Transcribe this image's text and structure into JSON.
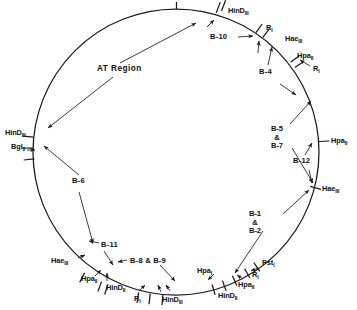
{
  "diagram": {
    "type": "circular-restriction-map",
    "title_region": "AT Region",
    "circle": {
      "cx": 176,
      "cy": 152,
      "r": 143
    },
    "enzyme_sites": [
      {
        "id": "hind3-top",
        "label": "HinD",
        "sub": "III",
        "x": 228,
        "y": 11,
        "align": "left",
        "angle": -70
      },
      {
        "id": "ri-top",
        "label": "R",
        "sub": "I",
        "x": 266,
        "y": 27,
        "align": "left",
        "angle": -56
      },
      {
        "id": "hae3-topright",
        "label": "Hae",
        "sub": "III",
        "x": 285,
        "y": 38,
        "align": "left",
        "angle": -48
      },
      {
        "id": "hpa2-topright",
        "label": "Hpa",
        "sub": "II",
        "x": 298,
        "y": 55,
        "align": "left",
        "angle": -35
      },
      {
        "id": "ri-topright",
        "label": "R",
        "sub": "I",
        "x": 313,
        "y": 68,
        "align": "left",
        "angle": -28
      },
      {
        "id": "hpa2-right",
        "label": "Hpa",
        "sub": "II",
        "x": 331,
        "y": 140,
        "align": "left",
        "angle": 2
      },
      {
        "id": "hae3-right",
        "label": "Hae",
        "sub": "III",
        "x": 322,
        "y": 188,
        "align": "left",
        "angle": 18
      },
      {
        "id": "pst1-bottom",
        "label": "Pst",
        "sub": "I",
        "x": 262,
        "y": 263,
        "align": "left",
        "angle": 52
      },
      {
        "id": "ri-bottomright",
        "label": "R",
        "sub": "I",
        "x": 253,
        "y": 274,
        "align": "left",
        "angle": 58
      },
      {
        "id": "hpa2-bottom",
        "label": "Hpa",
        "sub": "II",
        "x": 240,
        "y": 285,
        "align": "left",
        "angle": 64
      },
      {
        "id": "hpa1-bottom",
        "label": "Hpa",
        "sub": "I",
        "x": 198,
        "y": 270,
        "align": "left",
        "angle": 70
      },
      {
        "id": "hind2-bottomr",
        "label": "HinD",
        "sub": "II",
        "x": 222,
        "y": 295,
        "align": "left",
        "angle": 72
      },
      {
        "id": "hind3-bottom",
        "label": "HinD",
        "sub": "III",
        "x": 163,
        "y": 299,
        "align": "left",
        "angle": 92
      },
      {
        "id": "ri-bottom",
        "label": "R",
        "sub": "I",
        "x": 136,
        "y": 297,
        "align": "left",
        "angle": 99
      },
      {
        "id": "hind2-bottoml",
        "label": "HinD",
        "sub": "II",
        "x": 109,
        "y": 287,
        "align": "left",
        "angle": 110
      },
      {
        "id": "hpa2-bottoml",
        "label": "Hpa",
        "sub": "II",
        "x": 83,
        "y": 279,
        "align": "left",
        "angle": 116
      },
      {
        "id": "hae3-left",
        "label": "Hae",
        "sub": "III",
        "x": 55,
        "y": 261,
        "align": "left",
        "angle": 126
      },
      {
        "id": "hind3-left",
        "label": "HinD",
        "sub": "III",
        "x": 7,
        "y": 133,
        "align": "left",
        "angle": 186
      },
      {
        "id": "bgl2-left",
        "label": "Bgl",
        "sub": "II",
        "x": 14,
        "y": 147,
        "align": "left",
        "angle": 193
      }
    ],
    "fragments": [
      {
        "id": "b10",
        "label": "B-10",
        "x": 213,
        "y": 37
      },
      {
        "id": "b4",
        "label": "B-4",
        "x": 262,
        "y": 72
      },
      {
        "id": "b5b7",
        "label": [
          "B-5",
          "&",
          "B-7"
        ],
        "x": 281,
        "y": 133
      },
      {
        "id": "b12",
        "label": "B-12",
        "x": 305,
        "y": 161
      },
      {
        "id": "b1b2",
        "label": [
          "B-1",
          "&",
          "B-2"
        ],
        "x": 259,
        "y": 218
      },
      {
        "id": "b11",
        "label": "B-11",
        "x": 101,
        "y": 245
      },
      {
        "id": "b8b9",
        "label": "B-8 & B-9",
        "x": 128,
        "y": 261
      },
      {
        "id": "b6",
        "label": "B-6",
        "x": 74,
        "y": 181
      }
    ],
    "annotations": [
      {
        "id": "at-region",
        "label": "AT Region",
        "x": 97,
        "y": 69
      }
    ],
    "colors": {
      "stroke": "#1a1a1a",
      "text": "#111111",
      "background": "#ffffff"
    }
  }
}
